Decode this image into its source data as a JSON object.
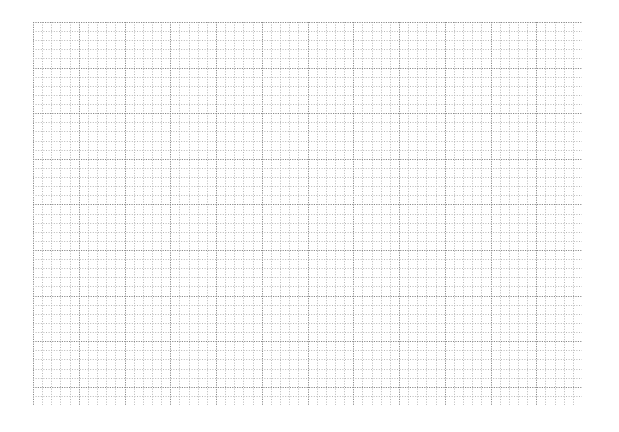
{
  "page": {
    "background": "#ffffff",
    "grid": {
      "type": "graph-paper",
      "columns": 60,
      "rows": 42,
      "major_every": 5,
      "minor_color": "#b8b8b8",
      "major_color": "#8a8a8a",
      "line_style": "dotted"
    }
  }
}
